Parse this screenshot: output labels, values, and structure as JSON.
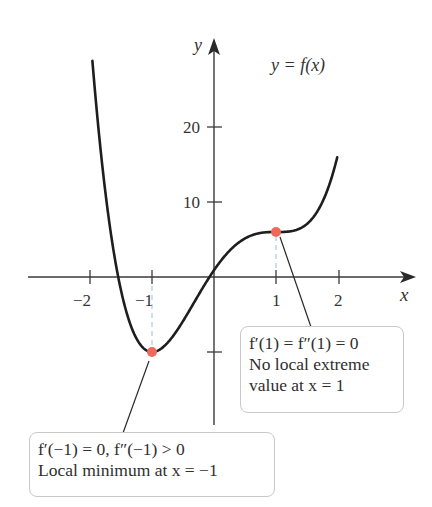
{
  "chart_data": {
    "type": "line",
    "title": "",
    "function_label": "y = f(x)",
    "function_formula": "f(x) = 3x^4 - 4x^3 - 6x^2 + 12x + 1",
    "xlabel": "x",
    "ylabel": "y",
    "xlim": [
      -2.0,
      2.3
    ],
    "ylim": [
      -12,
      30
    ],
    "x_ticks": [
      -2,
      -1,
      1,
      2
    ],
    "x_tick_labels": [
      "−2",
      "−1",
      "1",
      "2"
    ],
    "y_ticks": [
      -10,
      10,
      20
    ],
    "y_tick_labels": [
      "",
      "10",
      "20"
    ],
    "grid": false,
    "series": [
      {
        "name": "y = f(x)",
        "x": [
          -1.96,
          -1.75,
          -1.5,
          -1.25,
          -1.0,
          -0.75,
          -0.5,
          -0.25,
          0.0,
          0.25,
          0.5,
          0.75,
          1.0,
          1.25,
          1.5,
          1.75,
          1.97
        ],
        "y": [
          30.0,
          13.4,
          0.3,
          -7.8,
          -10.0,
          -8.4,
          -4.8,
          -1.9,
          1.0,
          3.6,
          5.2,
          5.9,
          6.0,
          6.3,
          8.2,
          13.8,
          26.0
        ]
      }
    ],
    "highlighted_points": [
      {
        "x": -1,
        "y": -10,
        "label": "Local minimum"
      },
      {
        "x": 1,
        "y": 6,
        "label": "No local extreme"
      }
    ],
    "annotations": [
      {
        "target": {
          "x": 1,
          "y": 6
        },
        "lines": [
          "f′(1) = f″(1) = 0",
          "No local extreme",
          "value at x = 1"
        ]
      },
      {
        "target": {
          "x": -1,
          "y": -10
        },
        "lines": [
          "f′(−1) = 0, f″(−1) > 0",
          "Local minimum at x = −1"
        ]
      }
    ]
  },
  "labels": {
    "y_axis": "y",
    "x_axis": "x",
    "curve": "y = f(x)",
    "ytick_20": "20",
    "ytick_10": "10",
    "xtick_m2": "−2",
    "xtick_m1": "−1",
    "xtick_1": "1",
    "xtick_2": "2"
  },
  "notes": {
    "inflection": {
      "line1": "f′(1) = f″(1) = 0",
      "line2": "No local extreme",
      "line3": "value at x = 1"
    },
    "minimum": {
      "line1": "f′(−1) = 0, f″(−1) > 0",
      "line2": "Local minimum at x = −1"
    }
  },
  "colors": {
    "curve": "#1e1e1e",
    "axis": "#3a3a3a",
    "point": "#f0685a",
    "dashed_guide": "#8fc6dd",
    "box_border": "#c9c9c9"
  }
}
